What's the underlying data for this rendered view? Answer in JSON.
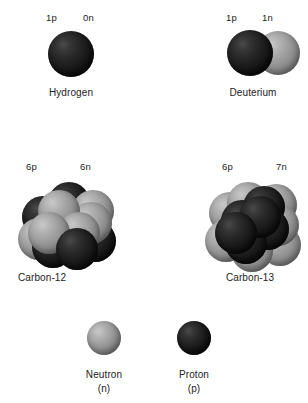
{
  "figure": {
    "background_color": "#ffffff",
    "proton_color": "#1a1a1a",
    "neutron_color": "#9a9a9a"
  },
  "atoms": [
    {
      "id": "hydrogen",
      "caption": "Hydrogen",
      "proton_label": "1p",
      "neutron_label": "0n",
      "protons": 1,
      "neutrons": 0
    },
    {
      "id": "deuterium",
      "caption": "Deuterium",
      "proton_label": "1p",
      "neutron_label": "1n",
      "protons": 1,
      "neutrons": 1
    },
    {
      "id": "carbon-12",
      "caption": "Carbon-12",
      "proton_label": "6p",
      "neutron_label": "6n",
      "protons": 6,
      "neutrons": 6
    },
    {
      "id": "carbon-13",
      "caption": "Carbon-13",
      "proton_label": "6p",
      "neutron_label": "7n",
      "protons": 6,
      "neutrons": 7
    }
  ],
  "legend": [
    {
      "id": "neutron",
      "name": "Neutron",
      "symbol": "(n)",
      "particle": "neutron"
    },
    {
      "id": "proton",
      "name": "Proton",
      "symbol": "(p)",
      "particle": "proton"
    }
  ]
}
